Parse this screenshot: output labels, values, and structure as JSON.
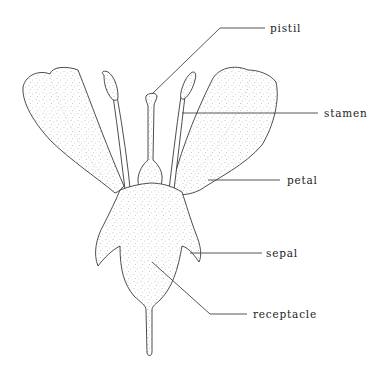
{
  "diagram": {
    "labels": [
      {
        "id": "pistil",
        "text": "pistil"
      },
      {
        "id": "stamen",
        "text": "stamen"
      },
      {
        "id": "petal",
        "text": "petal"
      },
      {
        "id": "sepal",
        "text": "sepal"
      },
      {
        "id": "receptacle",
        "text": "receptacle"
      }
    ],
    "colors": {
      "line": "#3a3a3a",
      "stipple": "#8a8a8a",
      "background": "#ffffff"
    }
  }
}
